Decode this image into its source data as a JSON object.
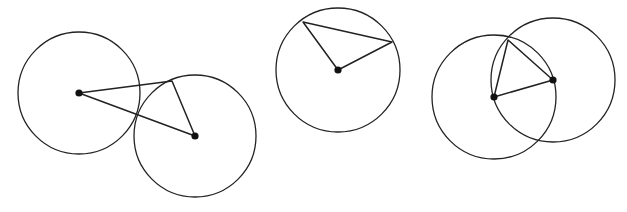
{
  "diagram": {
    "title": "",
    "colors": {
      "stroke": "#222222",
      "point": "#111111",
      "background": "#ffffff"
    },
    "figures": [
      {
        "id": "two-circles-apart",
        "circles": [
          {
            "cx": 79,
            "cy": 93,
            "r": 61
          },
          {
            "cx": 195,
            "cy": 136,
            "r": 61
          }
        ],
        "triangle": [
          [
            79,
            93
          ],
          [
            172,
            81
          ],
          [
            195,
            136
          ]
        ],
        "centers": [
          [
            79,
            93
          ],
          [
            195,
            136
          ]
        ]
      },
      {
        "id": "single-circle",
        "circles": [
          {
            "cx": 338,
            "cy": 70,
            "r": 62
          }
        ],
        "triangle": [
          [
            338,
            70
          ],
          [
            303,
            22
          ],
          [
            392,
            42
          ]
        ],
        "centers": [
          [
            338,
            70
          ]
        ]
      },
      {
        "id": "two-circles-overlapping",
        "circles": [
          {
            "cx": 494,
            "cy": 97,
            "r": 62
          },
          {
            "cx": 553,
            "cy": 80,
            "r": 62
          }
        ],
        "triangle": [
          [
            494,
            97
          ],
          [
            508,
            40
          ],
          [
            553,
            80
          ]
        ],
        "centers": [
          [
            494,
            97
          ],
          [
            553,
            80
          ]
        ]
      }
    ]
  }
}
